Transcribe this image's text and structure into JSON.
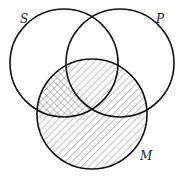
{
  "diagram": {
    "type": "venn-3",
    "sets": [
      {
        "label": "S",
        "cx": 64,
        "cy": 63,
        "r": 54
      },
      {
        "label": "P",
        "cx": 120,
        "cy": 63,
        "r": 54
      },
      {
        "label": "M",
        "cx": 92,
        "cy": 114,
        "r": 55
      }
    ],
    "shading": [
      {
        "region": "M",
        "pattern": "diagonal-hatch"
      },
      {
        "region": "S∩M−P",
        "pattern": "cross-hatch"
      }
    ],
    "colors": {
      "stroke": "#111111",
      "hatch": "#777777",
      "background": "#ffffff"
    }
  }
}
